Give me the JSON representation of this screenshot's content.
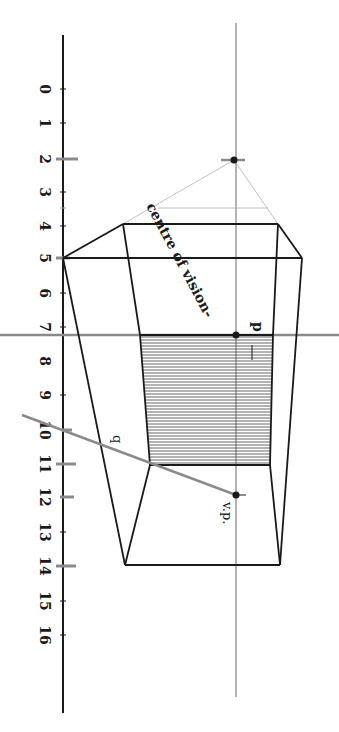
{
  "figure": {
    "scale": {
      "labels": [
        "0",
        "1",
        "2",
        "3",
        "4",
        "5",
        "6",
        "7",
        "8",
        "9",
        "10",
        "11",
        "12",
        "13",
        "14",
        "15",
        "16"
      ],
      "tick_y": [
        89,
        123,
        159,
        192,
        226,
        258,
        293,
        327,
        361,
        395,
        430,
        464,
        497,
        532,
        566,
        601,
        635
      ],
      "highlighted": [
        "2",
        "8",
        "10",
        "11",
        "12",
        "14"
      ]
    },
    "labels": {
      "centre_of_vision": "centre of vision-",
      "p": "p",
      "q": "q",
      "vp": "v.p."
    },
    "colors": {
      "ink": "#1a1a1a",
      "gray_line": "#8a8a8a",
      "light_line": "#b0b0b0",
      "hatch": "#555555",
      "background": "#ffffff"
    }
  }
}
